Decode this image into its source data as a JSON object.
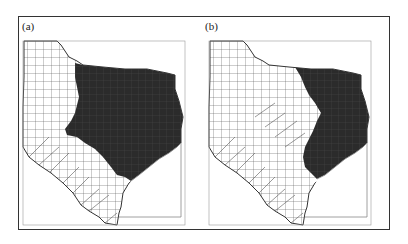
{
  "figure": {
    "panels": [
      {
        "label": "(a)",
        "description": "Texas counties map, eastern region shaded dark"
      },
      {
        "label": "(b)",
        "description": "Texas counties map, smaller eastern region shaded dark"
      }
    ],
    "colors": {
      "shaded": "#2b2b2b",
      "unshaded": "#ffffff",
      "border": "#333333",
      "county_line": "#444444"
    }
  }
}
